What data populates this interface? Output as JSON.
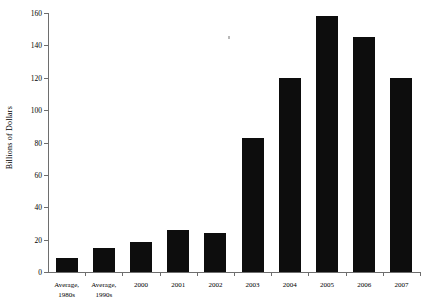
{
  "chart_data": {
    "type": "bar",
    "title": "",
    "xlabel": "",
    "ylabel": "Billions of Dollars",
    "ylim": [
      0,
      160
    ],
    "yticks": [
      0,
      20,
      40,
      60,
      80,
      100,
      120,
      140,
      160
    ],
    "ytick_labels": [
      "0",
      "20",
      "40",
      "60",
      "80",
      "100",
      "120",
      "140",
      "160"
    ],
    "grid": false,
    "legend": false,
    "bar_color": "#0d0d0d",
    "axis_color": "#6e6e6e",
    "background": "#ffffff",
    "categories": [
      "Average, 1980s",
      "Average, 1990s",
      "2000",
      "2001",
      "2002",
      "2003",
      "2004",
      "2005",
      "2006",
      "2007"
    ],
    "category_lines": [
      [
        "Average,",
        "1980s"
      ],
      [
        "Average,",
        "1990s"
      ],
      [
        "2000",
        ""
      ],
      [
        "2001",
        ""
      ],
      [
        "2002",
        ""
      ],
      [
        "2003",
        ""
      ],
      [
        "2004",
        ""
      ],
      [
        "2005",
        ""
      ],
      [
        "2006",
        ""
      ],
      [
        "2007",
        ""
      ]
    ],
    "values": [
      8.5,
      15,
      18.5,
      26,
      24,
      83,
      120,
      158,
      145,
      120
    ]
  }
}
